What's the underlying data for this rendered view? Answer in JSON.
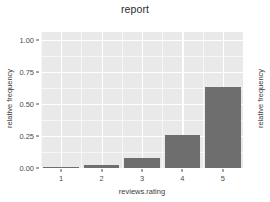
{
  "chart_data": {
    "type": "bar",
    "title": "report",
    "xlabel": "reviews.rating",
    "ylabel": "relative frequency",
    "ylabel_right": "relative frequency",
    "categories": [
      "1",
      "2",
      "3",
      "4",
      "5"
    ],
    "values": [
      0.01,
      0.025,
      0.08,
      0.26,
      0.63
    ],
    "ylim": [
      0.0,
      1.06
    ],
    "ytick_labels": [
      "0.00",
      "0.25",
      "0.50",
      "0.75",
      "1.00"
    ],
    "ytick_values": [
      0.0,
      0.25,
      0.5,
      0.75,
      1.0
    ],
    "yminor_values": [
      0.125,
      0.375,
      0.625,
      0.875
    ],
    "grid": true,
    "legend": "none",
    "bar_color": "#6e6e6e",
    "panel_color": "#e9e9e9",
    "grid_color": "#ffffff",
    "text_color": "#4d4d4d"
  }
}
